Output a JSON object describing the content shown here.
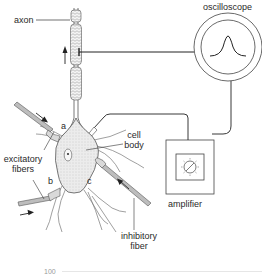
{
  "diagram": {
    "title": "",
    "labels": {
      "axon": "axon",
      "oscilloscope": "oscilloscope",
      "cell_body_line1": "cell",
      "cell_body_line2": "body",
      "excitatory_line1": "excitatory",
      "excitatory_line2": "fibers",
      "inhibitory_line1": "inhibitory",
      "inhibitory_line2": "fiber",
      "amplifier": "amplifier",
      "synapse_a": "a",
      "synapse_b": "b",
      "synapse_c": "c"
    },
    "bottom_fragment": "100",
    "colors": {
      "line": "#222222",
      "soma_fill": "#ebebeb",
      "fiber_fill": "#bdbdbd",
      "background": "#ffffff"
    },
    "components": [
      "neuron (axon, cell body, dendrites)",
      "excitatory fiber a",
      "excitatory fiber b",
      "inhibitory fiber c",
      "recording electrode",
      "stimulating electrode",
      "amplifier",
      "oscilloscope"
    ]
  }
}
